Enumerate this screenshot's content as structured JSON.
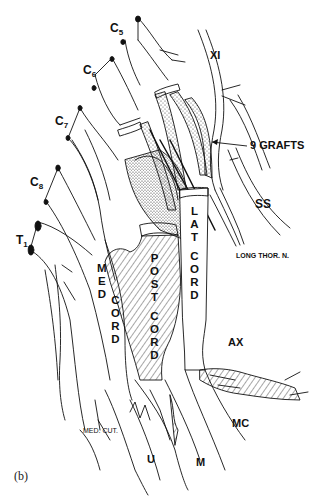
{
  "figure": {
    "caption": "(b)",
    "roots": [
      {
        "id": "C5",
        "base": "C",
        "sub": "5"
      },
      {
        "id": "C6",
        "base": "C",
        "sub": "6"
      },
      {
        "id": "C7",
        "base": "C",
        "sub": "7"
      },
      {
        "id": "C8",
        "base": "C",
        "sub": "8"
      },
      {
        "id": "T1",
        "base": "T",
        "sub": "1"
      }
    ],
    "labels": {
      "xi": "XI",
      "grafts": "9 GRAFTS",
      "ss": "SS",
      "long_thor": "LONG THOR. N.",
      "lat_cord": [
        "L",
        "A",
        "T",
        "",
        "C",
        "O",
        "R",
        "D"
      ],
      "post_cord": [
        "P",
        "O",
        "S",
        "T",
        "",
        "C",
        "O",
        "R",
        "D"
      ],
      "med_cord_1": [
        "M",
        "E",
        "D"
      ],
      "med_cord_2": [
        "C",
        "O",
        "R",
        "D"
      ],
      "ax": "AX",
      "mc": "MC",
      "med_cut": "MED. CUT.",
      "u": "U",
      "m": "M"
    },
    "colors": {
      "ink": "#111111",
      "background": "#ffffff"
    }
  }
}
